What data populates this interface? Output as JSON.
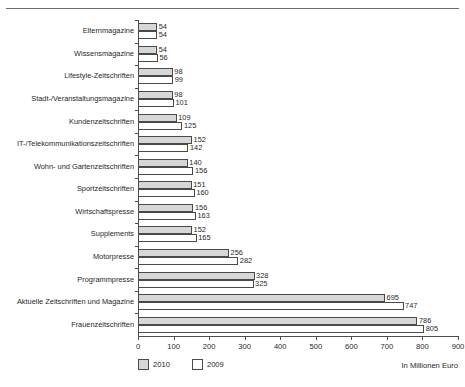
{
  "page": {
    "ghost_top_text": "·   ·    ·   ·  ·",
    "background": "#ffffff",
    "axis_color": "#4c4c4c"
  },
  "chart_data": {
    "type": "bar",
    "orientation": "horizontal",
    "title": "",
    "subtitle": "",
    "xlabel": "In Millionen Euro",
    "ylabel": "",
    "xlim": [
      0,
      900
    ],
    "xticks": [
      0,
      100,
      200,
      300,
      400,
      500,
      600,
      700,
      800,
      900
    ],
    "xtick_labels": [
      "0",
      "100",
      "200",
      "300",
      "400",
      "500",
      "600",
      "700",
      "800",
      "900"
    ],
    "grid": false,
    "legend_position": "bottom-left",
    "categories": [
      "Elternmagazine",
      "Wissensmagazine",
      "Lifestyle-Zeitschriften",
      "Stadt-/Veranstaltungsmagazine",
      "Kundenzeitschriften",
      "IT-/Telekommunikationszeitschriften",
      "Wohn- und Gartenzeitschriften",
      "Sportzeitschriften",
      "Wirtschaftspresse",
      "Supplements",
      "Motorpresse",
      "Programmpresse",
      "Aktuelle Zeitschriften und Magazine",
      "Frauenzeitschriften"
    ],
    "series": [
      {
        "name": "2010",
        "color": "#d7d7d7",
        "values": [
          54,
          54,
          98,
          98,
          109,
          152,
          140,
          151,
          156,
          152,
          256,
          328,
          695,
          786
        ]
      },
      {
        "name": "2009",
        "color": "#ffffff",
        "values": [
          54,
          56,
          99,
          101,
          125,
          142,
          156,
          160,
          163,
          165,
          282,
          325,
          747,
          805
        ]
      }
    ],
    "legend": [
      "2010",
      "2009"
    ]
  }
}
